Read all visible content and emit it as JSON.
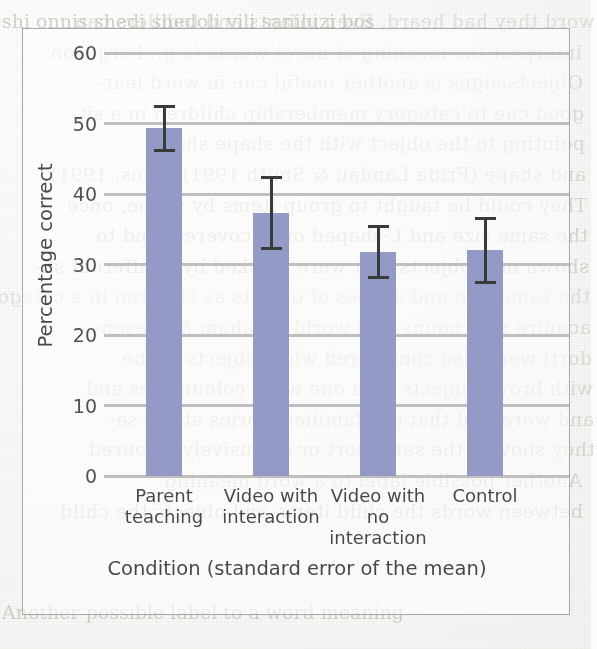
{
  "page": {
    "bleed_through_lines": [
      "word they had heard. Even infants and toddlers can",
      "interpret the meaning of novel words (e.g., Ferguson",
      "Objects/signs is another useful cue in word lear-",
      "good cue to category membership children in a sit-",
      "pointing to the object with the shape shape",
      "and shape (Frida Landau & Smith 1991). Thus, 1991)",
      "They could be taught to group items by shape, once",
      "the same size and L-shaped once covered, and to",
      "shown new objects that were blocked by a different sh-",
      "the same size and shapes of objects as children in a categor-",
      "acquire new nouns, the world (Graham & Diesen-",
      "dorf) were also considered when objects of the",
      "with brown objects with one word colour, files and",
      "and were told that our families stories at the sa-",
      "they showed the same sort or exclusively coloured",
      "Another possible label to a word meaning",
      "between words the child items and objects the child"
    ],
    "bleed_through_upright": [
      "shi onnis shedi shedoli vili saniluzi bos",
      "Another possible label to a word meaning"
    ]
  },
  "chart_data": {
    "type": "bar",
    "title": "",
    "xlabel": "Condition (standard error of the mean)",
    "ylabel": "Percentage correct",
    "categories": [
      "Parent teaching",
      "Video with interaction",
      "Video with no interaction",
      "Control"
    ],
    "category_lines": [
      [
        "Parent",
        "teaching"
      ],
      [
        "Video with",
        "interaction"
      ],
      [
        "Video with",
        "no interaction"
      ],
      [
        "Control",
        ""
      ]
    ],
    "values": [
      49.3,
      37.3,
      31.8,
      32.0
    ],
    "errors": [
      3.3,
      5.3,
      3.8,
      4.8
    ],
    "error_type": "standard error of the mean",
    "ylim": [
      0,
      60
    ],
    "yticks": [
      60,
      50,
      40,
      30,
      20,
      10,
      0
    ],
    "ytick_labels": [
      "60",
      "50",
      "40",
      "30",
      "20",
      "10",
      "0"
    ],
    "grid": true,
    "grid_axis": "y",
    "legend": "none",
    "bar_color": "#7d86bb",
    "gridline_color": "#a6a6a6",
    "errorbar_color": "#111111"
  }
}
